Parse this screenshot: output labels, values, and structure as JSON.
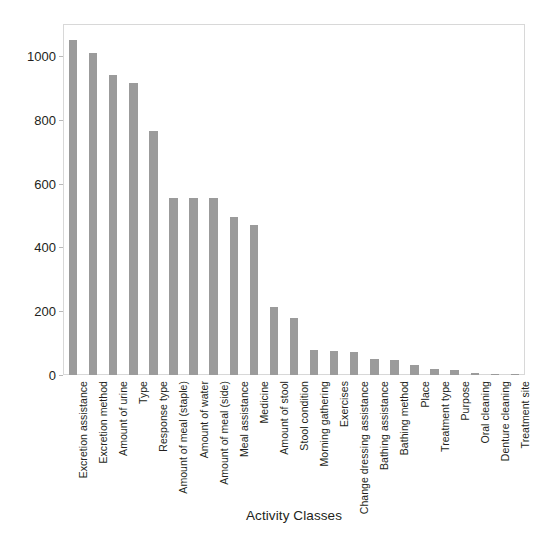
{
  "chart_data": {
    "type": "bar",
    "title": "",
    "xlabel": "Activity Classes",
    "ylabel": "Number of samples",
    "ylim": [
      0,
      1100
    ],
    "yticks": [
      0,
      200,
      400,
      600,
      800,
      1000
    ],
    "grid": false,
    "legend": "none",
    "bar_color": "#9b9b9b",
    "axis_color": "#d8d8d8",
    "categories": [
      "Excretion assistance",
      "Excretion method",
      "Amount of urine",
      "Type",
      "Response type",
      "Amount of meal (staple)",
      "Amount of water",
      "Amount of meal (side)",
      "Meal assistance",
      "Medicine",
      "Amount of stool",
      "Stool condition",
      "Morning gathering",
      "Exercises",
      "Change dressing assistance",
      "Bathing assistance",
      "Bathing method",
      "Place",
      "Treatment type",
      "Purpose",
      "Oral cleaning",
      "Denture cleaning",
      "Treatment site"
    ],
    "values": [
      1050,
      1010,
      940,
      915,
      765,
      555,
      555,
      555,
      495,
      470,
      213,
      180,
      78,
      76,
      72,
      50,
      48,
      30,
      18,
      16,
      5,
      4,
      3
    ]
  },
  "figure": {
    "caption": ""
  }
}
